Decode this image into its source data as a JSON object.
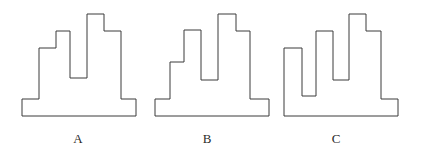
{
  "figure": {
    "kind": "outline-diagram",
    "canvas": {
      "width": 421,
      "height": 159
    },
    "stroke_color": "#3a3a3a",
    "fill_color": "#ffffff",
    "background_color": "#ffffff",
    "stroke_width": 1,
    "baseline_y": 116
  },
  "shapes": [
    {
      "id": "shape-a",
      "label": "A",
      "label_x": 78,
      "label_y": 139,
      "bounds": {
        "x": 22,
        "y": 14,
        "width": 114,
        "height": 102
      },
      "points": "22,116 22,99 39,99 39,48 56,48 56,31 70,31 70,78 87,78 87,14 104,14 104,31 121,31 121,99 136,99 136,116"
    },
    {
      "id": "shape-b",
      "label": "B",
      "label_x": 207,
      "label_y": 139,
      "bounds": {
        "x": 155,
        "y": 14,
        "width": 114,
        "height": 102
      },
      "points": "155,116 155,99 170,99 170,62 184,62 184,30 201,30 201,80 218,80 218,14 236,14 236,31 250,31 250,99 269,99 269,116"
    },
    {
      "id": "shape-c",
      "label": "C",
      "label_x": 336,
      "label_y": 139,
      "bounds": {
        "x": 284,
        "y": 14,
        "width": 114,
        "height": 102
      },
      "points": "284,116 284,48 302,48 302,96 316,96 316,31 333,31 333,80 349,80 349,14 366,14 366,31 381,31 381,99 398,99 398,116"
    }
  ],
  "labels": {
    "a": "A",
    "b": "B",
    "c": "C"
  }
}
